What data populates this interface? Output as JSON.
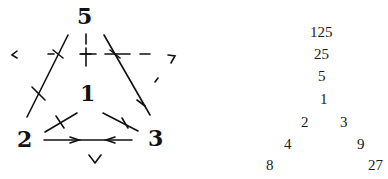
{
  "diagram": {
    "nodes": {
      "top": "5",
      "center": "1",
      "left": "2",
      "right": "3"
    },
    "stroke_color": "#111111"
  },
  "number_triangle": {
    "rows": [
      [
        "125"
      ],
      [
        "25"
      ],
      [
        "5"
      ],
      [
        "1"
      ],
      [
        "2",
        "3"
      ],
      [
        "4",
        "9"
      ],
      [
        "8",
        "27"
      ]
    ]
  }
}
